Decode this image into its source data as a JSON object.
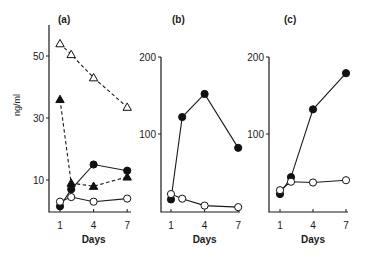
{
  "chart_data": [
    {
      "type": "line",
      "panel": "(a)",
      "title": "(a)",
      "xlabel": "Days",
      "ylabel": "ng/ml",
      "x_ticks": [
        1,
        4,
        7
      ],
      "y_ticks": [
        10,
        30,
        50
      ],
      "ylim": [
        0,
        58
      ],
      "xlim": [
        0,
        7.2
      ],
      "grid": false,
      "series": [
        {
          "name": "open triangles",
          "marker": "triangle-open",
          "line": "dashed",
          "x": [
            1,
            2,
            4,
            7
          ],
          "values": [
            54,
            50.5,
            43,
            33.5
          ]
        },
        {
          "name": "filled triangles",
          "marker": "triangle-filled",
          "line": "dashed",
          "x": [
            1,
            2,
            4,
            7
          ],
          "values": [
            36,
            9,
            8,
            11
          ]
        },
        {
          "name": "filled circles",
          "marker": "circle-filled",
          "line": "solid",
          "x": [
            1,
            2,
            4,
            7
          ],
          "values": [
            1.5,
            7,
            15,
            13
          ]
        },
        {
          "name": "open circles",
          "marker": "circle-open",
          "line": "solid",
          "x": [
            1,
            2,
            4,
            7
          ],
          "values": [
            3,
            4.5,
            3,
            4
          ]
        }
      ]
    },
    {
      "type": "line",
      "panel": "(b)",
      "title": "(b)",
      "xlabel": "Days",
      "ylabel": "",
      "x_ticks": [
        1,
        4,
        7
      ],
      "y_ticks": [
        100,
        200
      ],
      "ylim": [
        0,
        200
      ],
      "xlim": [
        0,
        7.2
      ],
      "grid": false,
      "series": [
        {
          "name": "filled circles",
          "marker": "circle-filled",
          "line": "solid",
          "x": [
            1,
            2,
            4,
            7
          ],
          "values": [
            15,
            122,
            152,
            82
          ]
        },
        {
          "name": "open circles",
          "marker": "circle-open",
          "line": "solid",
          "x": [
            1,
            2,
            4,
            7
          ],
          "values": [
            22,
            16,
            7,
            5
          ]
        }
      ]
    },
    {
      "type": "line",
      "panel": "(c)",
      "title": "(c)",
      "xlabel": "Days",
      "ylabel": "",
      "x_ticks": [
        1,
        4,
        7
      ],
      "y_ticks": [
        100,
        200
      ],
      "ylim": [
        0,
        200
      ],
      "xlim": [
        0,
        7.2
      ],
      "grid": false,
      "series": [
        {
          "name": "filled circles",
          "marker": "circle-filled",
          "line": "solid",
          "x": [
            1,
            2,
            4,
            7
          ],
          "values": [
            22,
            44,
            132,
            179
          ]
        },
        {
          "name": "open circles",
          "marker": "circle-open",
          "line": "solid",
          "x": [
            1,
            2,
            4,
            7
          ],
          "values": [
            27,
            38,
            37,
            40
          ]
        }
      ]
    }
  ],
  "layout": {
    "panels": [
      {
        "axis_x": 49,
        "axis_top": 25,
        "axis_bottom": 212,
        "axis_right": 131,
        "day1_x": 60,
        "px_per_day": 11.2,
        "y_zero": 211,
        "px_per_unit": 3.1,
        "label_x": 58,
        "label_y": 23,
        "ylabel_x": 14,
        "ylabel_y": 105
      },
      {
        "axis_x": 161,
        "axis_top": 57,
        "axis_bottom": 212,
        "axis_right": 240,
        "day1_x": 171,
        "px_per_day": 11.2,
        "y_zero": 211,
        "px_per_unit": 0.77,
        "label_x": 172,
        "label_y": 23
      },
      {
        "axis_x": 269,
        "axis_top": 57,
        "axis_bottom": 212,
        "axis_right": 348,
        "day1_x": 280,
        "px_per_day": 11.0,
        "y_zero": 211,
        "px_per_unit": 0.77,
        "label_x": 284,
        "label_y": 23
      }
    ]
  }
}
